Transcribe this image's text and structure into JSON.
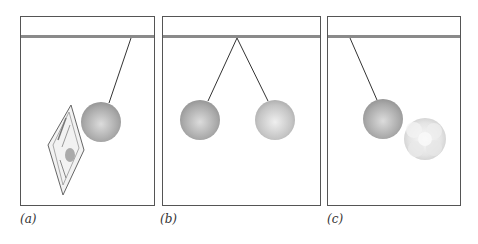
{
  "figure": {
    "panels": [
      {
        "id": "a",
        "label": "(a)",
        "description": "Charged ball on string attracted toward a newspaper"
      },
      {
        "id": "b",
        "label": "(b)",
        "description": "Two balls hanging from a common point repel each other"
      },
      {
        "id": "c",
        "label": "(c)",
        "description": "Ball attracted toward a cotton ball"
      }
    ],
    "colors": {
      "frame": "#555555",
      "ceiling_bar": "#8a8a8a",
      "string": "#333333",
      "ball_dark": "#a8a8a8",
      "ball_light": "#e0e0e0",
      "cotton": "#ececec"
    }
  }
}
